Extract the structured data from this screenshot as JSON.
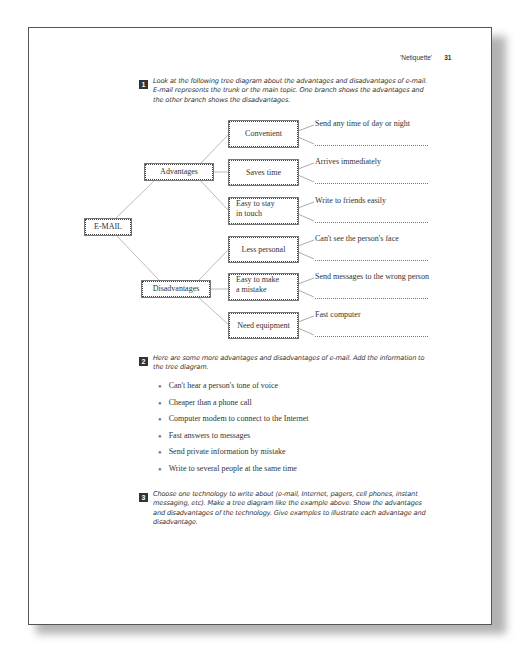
{
  "header": {
    "running_title": "'Netiquette'",
    "page_number": "31"
  },
  "exercise1": {
    "number": "1",
    "instructions": [
      "Look at the following tree diagram about the advantages and disadvantages of e-mail.",
      "E-mail represents the trunk or the main topic.  One branch shows the advantages and",
      "the other branch shows the disadvantages."
    ]
  },
  "tree": {
    "root": "E-MAIL",
    "branches": [
      {
        "label": "Advantages",
        "items": [
          {
            "label": "Convenient",
            "example": "Send any time of day or night"
          },
          {
            "label": "Saves time",
            "example": "Arrives immediately"
          },
          {
            "label_lines": [
              "Easy to stay",
              "in touch"
            ],
            "example": "Write to friends easily"
          }
        ]
      },
      {
        "label": "Disadvantages",
        "items": [
          {
            "label": "Less personal",
            "example": "Can't see the person's face"
          },
          {
            "label_lines": [
              "Easy to make",
              "a mistake"
            ],
            "example": "Send messages to the wrong person"
          },
          {
            "label": "Need equipment",
            "example": "Fast computer"
          }
        ]
      }
    ]
  },
  "exercise2": {
    "number": "2",
    "instructions": [
      "Here are some more advantages and disadvantages of e-mail.  Add the information to",
      "the tree diagram."
    ],
    "bullets": [
      "Can't hear a person's tone of voice",
      "Cheaper than a phone call",
      "Computer modem to connect to the Internet",
      "Fast answers to messages",
      "Send private information by mistake",
      "Write to several people at the same time"
    ]
  },
  "exercise3": {
    "number": "3",
    "instructions": [
      "Choose one technology to write about (e-mail, Internet, pagers, cell phones, instant",
      "messaging, etc).  Make a tree diagram like the example above.  Show the advantages",
      "and disadvantages of the technology.  Give examples to illustrate each advantage and",
      "disadvantage."
    ]
  }
}
